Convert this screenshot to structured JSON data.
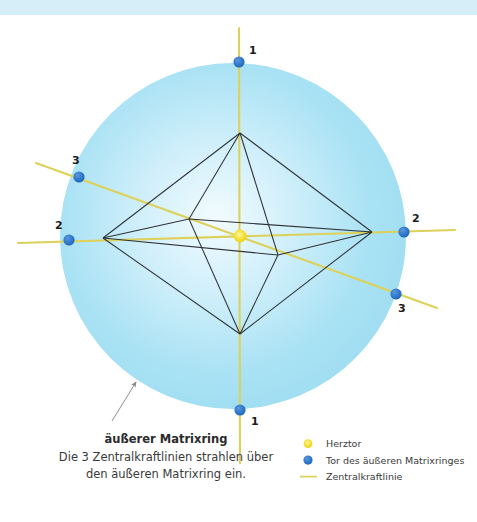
{
  "figure": {
    "background_color": "#ffffff",
    "banner_color": "#d6eef7",
    "ring_color": "#a5e0f2",
    "ring_color_inner": "#dff4fb",
    "node_color": "#2e75c8",
    "center_color": "#f5e13c",
    "force_line_color": "#ddd15a",
    "structure_line_color": "#2f3338"
  },
  "ring": {
    "cx": 233,
    "cy": 236,
    "r": 173
  },
  "center_node": {
    "name": "Herztor",
    "x": 240,
    "y": 236,
    "r": 6.5
  },
  "gate_nodes": [
    {
      "label": "1",
      "x": 239,
      "y": 62,
      "lx": 249,
      "ly": 54
    },
    {
      "label": "1",
      "x": 240,
      "y": 410,
      "lx": 251,
      "ly": 425
    },
    {
      "label": "2",
      "x": 69,
      "y": 240,
      "lx": 55,
      "ly": 229
    },
    {
      "label": "2",
      "x": 404,
      "y": 232,
      "lx": 412,
      "ly": 222
    },
    {
      "label": "3",
      "x": 79,
      "y": 177,
      "lx": 72,
      "ly": 164
    },
    {
      "label": "3",
      "x": 396,
      "y": 294,
      "lx": 398,
      "ly": 312
    }
  ],
  "force_lines": [
    {
      "name": "zentralkraftlinie-vertikal",
      "x1": 239,
      "y1": 28,
      "x2": 240,
      "y2": 463
    },
    {
      "name": "zentralkraftlinie-horizontal",
      "x1": 18,
      "y1": 243,
      "x2": 455,
      "y2": 230
    },
    {
      "name": "zentralkraftlinie-diagonal",
      "x1": 36,
      "y1": 163,
      "x2": 437,
      "y2": 308
    }
  ],
  "octahedron": {
    "top": {
      "x": 240,
      "y": 133
    },
    "bottom": {
      "x": 240,
      "y": 334
    },
    "left": {
      "x": 103,
      "y": 238
    },
    "right": {
      "x": 372,
      "y": 232
    },
    "back": {
      "x": 189,
      "y": 219
    },
    "front": {
      "x": 278,
      "y": 255
    }
  },
  "annotation": {
    "title": "äußerer Matrixring",
    "line1": "Die 3 Zentralkraftlinien strahlen über",
    "line2": "den äußeren Matrixring ein.",
    "arrow": {
      "x1": 112,
      "y1": 421,
      "x2": 136,
      "y2": 382
    }
  },
  "legend": {
    "items": [
      {
        "marker": "dot-yellow",
        "label": "Herztor"
      },
      {
        "marker": "dot-blue",
        "label": "Tor des äußeren Matrixringes"
      },
      {
        "marker": "line-yellow",
        "label": "Zentralkraftlinie"
      }
    ]
  }
}
